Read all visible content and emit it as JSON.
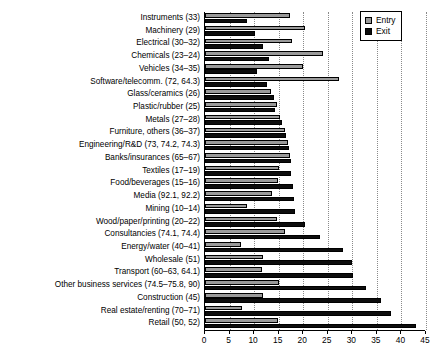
{
  "chart_data": {
    "type": "bar",
    "orientation": "horizontal",
    "title": "",
    "xlabel": "",
    "ylabel": "",
    "xlim": [
      0,
      45
    ],
    "xticks": [
      0,
      5,
      10,
      15,
      20,
      25,
      30,
      35,
      40,
      45
    ],
    "xticklabels": [
      "0",
      "5",
      "10",
      "15",
      "20",
      "25",
      "30",
      "35",
      "40",
      "45"
    ],
    "grid": "vertical-dotted",
    "legend_position": "top-right",
    "legend": [
      "Entry",
      "Exit"
    ],
    "colors": {
      "entry": "#9a9a9a",
      "exit": "#0d0d0d",
      "grid": "#8a8a8a",
      "axis": "#000000"
    },
    "categories": [
      "Instruments (33)",
      "Machinery (29)",
      "Electrical (30–32)",
      "Chemicals (23–24)",
      "Vehicles (34–35)",
      "Software/telecomm. (72, 64.3)",
      "Glass/ceramics (26)",
      "Plastic/rubber (25)",
      "Metals (27–28)",
      "Furniture, others (36–37)",
      "Engineering/R&D (73, 74.2, 74.3)",
      "Banks/insurances (65–67)",
      "Textiles (17–19)",
      "Food/beverages (15–16)",
      "Media (92.1, 92.2)",
      "Mining (10–14)",
      "Wood/paper/printing (20–22)",
      "Consultancies (74.1, 74.4)",
      "Energy/water (40–41)",
      "Wholesale (51)",
      "Transport (60–63, 64.1)",
      "Other business services (74.5–75.8, 90)",
      "Construction (45)",
      "Real estate/renting (70–71)",
      "Retail (50, 52)"
    ],
    "series": [
      {
        "name": "Entry",
        "values": [
          17.4,
          20.4,
          17.8,
          24.1,
          20.0,
          27.2,
          13.4,
          14.6,
          15.2,
          16.2,
          17.0,
          17.4,
          15.0,
          14.8,
          13.6,
          8.6,
          14.6,
          16.2,
          7.4,
          11.8,
          11.6,
          15.0,
          11.8,
          7.6,
          14.8
        ]
      },
      {
        "name": "Exit",
        "values": [
          8.6,
          10.2,
          11.8,
          13.0,
          10.6,
          12.6,
          14.0,
          14.2,
          15.6,
          16.4,
          17.2,
          17.6,
          17.6,
          18.0,
          18.2,
          18.4,
          20.4,
          23.4,
          28.0,
          30.0,
          30.2,
          32.8,
          35.8,
          37.8,
          43.0
        ]
      }
    ]
  }
}
